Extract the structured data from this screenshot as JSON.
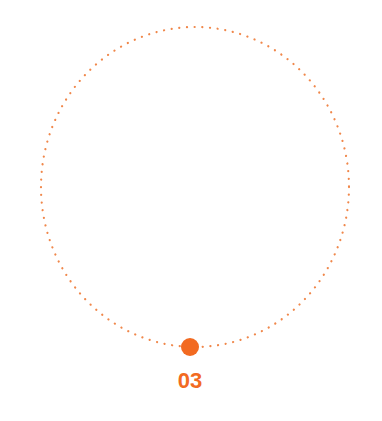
{
  "step": {
    "number": "03",
    "color": "#f26a21"
  }
}
